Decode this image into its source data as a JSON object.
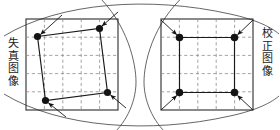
{
  "figure": {
    "type": "diagram",
    "width": 280,
    "height": 130,
    "background": "#ffffff"
  },
  "labels": {
    "left": {
      "text": "失真图像",
      "chars": [
        "失",
        "真",
        "图",
        "像"
      ],
      "meaning": "distorted image",
      "orientation": "vertical",
      "color": "#1a1a1a"
    },
    "right": {
      "text": "校正图像",
      "chars": [
        "校",
        "正",
        "图",
        "像"
      ],
      "meaning": "corrected image",
      "orientation": "vertical",
      "color": "#1a1a1a"
    }
  },
  "colors": {
    "frame": "#2b2b2b",
    "grid": "#8d8d8d",
    "arc": "#4a4a4a",
    "quad": "#1a1a1a",
    "dot": "#141414",
    "arrow": "#141414"
  },
  "panels": [
    {
      "name": "distorted-image-panel",
      "frame": {
        "x": 26,
        "y": 19,
        "width": 92,
        "height": 91
      },
      "grid": {
        "cols": 5,
        "rows": 5,
        "style": "dashed"
      },
      "quad_label": "distorted quadrilateral",
      "quad_points": [
        {
          "x": 37.5,
          "y": 36.5
        },
        {
          "x": 99.5,
          "y": 28.5
        },
        {
          "x": 107.5,
          "y": 92.5
        },
        {
          "x": 45.5,
          "y": 100.5
        }
      ],
      "dots": [
        {
          "x": 37.5,
          "y": 36.5,
          "r": 3.6
        },
        {
          "x": 99.5,
          "y": 28.5,
          "r": 3.6
        },
        {
          "x": 107.5,
          "y": 92.5,
          "r": 3.6
        },
        {
          "x": 45.5,
          "y": 100.5,
          "r": 3.6
        }
      ],
      "arrows": [
        {
          "x1": 62,
          "y1": 15,
          "x2": 40.5,
          "y2": 34.5
        },
        {
          "x1": 118,
          "y1": 12,
          "x2": 102,
          "y2": 26
        },
        {
          "x1": 126,
          "y1": 108,
          "x2": 110.5,
          "y2": 95
        },
        {
          "x1": 66,
          "y1": 117,
          "x2": 48.5,
          "y2": 103
        }
      ]
    },
    {
      "name": "corrected-image-panel",
      "frame": {
        "x": 161,
        "y": 19,
        "width": 92,
        "height": 91
      },
      "grid": {
        "cols": 5,
        "rows": 5,
        "style": "dashed"
      },
      "quad_label": "corrected square",
      "quad_points": [
        {
          "x": 179.5,
          "y": 37.5
        },
        {
          "x": 234.5,
          "y": 37.5
        },
        {
          "x": 234.5,
          "y": 92.5
        },
        {
          "x": 179.5,
          "y": 92.5
        }
      ],
      "dots": [
        {
          "x": 179.5,
          "y": 37.5,
          "r": 3.8
        },
        {
          "x": 234.5,
          "y": 37.5,
          "r": 3.8
        },
        {
          "x": 234.5,
          "y": 92.5,
          "r": 3.8
        },
        {
          "x": 179.5,
          "y": 92.5,
          "r": 3.8
        }
      ],
      "arrows": [
        {
          "x1": 161,
          "y1": 20,
          "x2": 176.8,
          "y2": 34.8
        },
        {
          "x1": 253,
          "y1": 20,
          "x2": 237.5,
          "y2": 34.8
        },
        {
          "x1": 253,
          "y1": 110,
          "x2": 237.5,
          "y2": 95.5
        },
        {
          "x1": 161,
          "y1": 110,
          "x2": 176.8,
          "y2": 95.5
        }
      ]
    }
  ],
  "arcs": [
    {
      "name": "arc-upper-left-to-right",
      "d": "M 4 36 C 60 2 150 -4 230 14 C 258 20 272 28 279 34"
    },
    {
      "name": "arc-lower-left-to-right",
      "d": "M 4 94 C 60 128 150 134 230 116 C 258 110 272 102 279 96"
    },
    {
      "name": "arc-left-lens-edge",
      "d": "M 96 -6 C 128 24 136 64 136 82 C 136 104 124 126 110 136"
    },
    {
      "name": "arc-right-lens-edge",
      "d": "M 186 -6 C 152 24 144 64 144 82 C 144 104 156 126 170 136"
    }
  ]
}
